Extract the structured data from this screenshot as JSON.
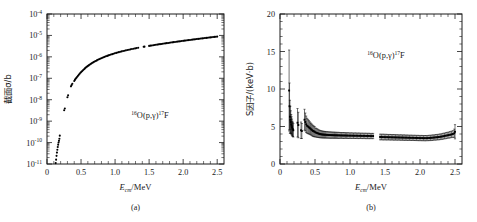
{
  "figure": {
    "panels": [
      {
        "id": "a",
        "caption": "(a)",
        "annotation": "¹⁶O(p,γ)¹⁷F",
        "annotation_parts": {
          "pre_sup": "16",
          "base": "O(p,γ)",
          "post_sup": "17",
          "tail": "F"
        },
        "xlabel_main": "E",
        "xlabel_sub": "cm",
        "xlabel_tail": "/MeV",
        "ylabel": "截面σ/b"
      },
      {
        "id": "b",
        "caption": "(b)",
        "annotation": "¹⁶O(p,γ)¹⁷F",
        "annotation_parts": {
          "pre_sup": "16",
          "base": "O(p,γ)",
          "post_sup": "17",
          "tail": "F"
        },
        "xlabel_main": "E",
        "xlabel_sub": "cm",
        "xlabel_tail": "/MeV",
        "ylabel_lead": "S",
        "ylabel": "S因子/(keV·b)"
      }
    ]
  },
  "chart_data": [
    {
      "type": "scatter",
      "panel": "a",
      "title": "",
      "annotation": "16O(p,γ)17F",
      "xlabel": "E_cm/MeV",
      "ylabel": "截面σ/b",
      "xlim": [
        0,
        2.6
      ],
      "ylim": [
        1e-11,
        0.0001
      ],
      "yscale": "log",
      "xscale": "linear",
      "grid": false,
      "legend": null,
      "xticks": [
        0,
        0.5,
        1.0,
        1.5,
        2.0,
        2.5
      ],
      "xticklabels": [
        "0",
        "0.5",
        "1.0",
        "1.5",
        "2.0",
        "2.5"
      ],
      "yticks": [
        1e-11,
        1e-10,
        1e-09,
        1e-08,
        1e-07,
        1e-06,
        1e-05,
        0.0001
      ],
      "yticklabels": [
        "10^-11",
        "10^-10",
        "10^-9",
        "10^-8",
        "10^-7",
        "10^-6",
        "10^-5",
        "10^-4"
      ],
      "x": [
        0.128,
        0.134,
        0.14,
        0.146,
        0.152,
        0.158,
        0.164,
        0.17,
        0.176,
        0.182,
        0.188,
        0.252,
        0.262,
        0.3,
        0.31,
        0.352,
        0.362,
        0.372,
        0.4,
        0.41,
        0.42,
        0.432,
        0.444,
        0.456,
        0.468,
        0.48,
        0.492,
        0.505,
        0.518,
        0.531,
        0.544,
        0.557,
        0.57,
        0.584,
        0.598,
        0.612,
        0.626,
        0.64,
        0.655,
        0.67,
        0.685,
        0.7,
        0.716,
        0.732,
        0.748,
        0.764,
        0.78,
        0.797,
        0.814,
        0.831,
        0.848,
        0.866,
        0.884,
        0.902,
        0.92,
        0.939,
        0.958,
        0.977,
        0.996,
        1.016,
        1.036,
        1.056,
        1.076,
        1.097,
        1.118,
        1.139,
        1.16,
        1.182,
        1.204,
        1.226,
        1.248,
        1.271,
        1.294,
        1.317,
        1.34,
        1.42,
        1.432,
        1.5,
        1.52,
        1.54,
        1.56,
        1.58,
        1.6,
        1.62,
        1.64,
        1.66,
        1.68,
        1.7,
        1.72,
        1.74,
        1.76,
        1.78,
        1.8,
        1.82,
        1.84,
        1.86,
        1.88,
        1.9,
        1.92,
        1.94,
        1.96,
        1.98,
        2.0,
        2.02,
        2.04,
        2.06,
        2.08,
        2.1,
        2.12,
        2.14,
        2.16,
        2.18,
        2.2,
        2.22,
        2.24,
        2.26,
        2.28,
        2.3,
        2.32,
        2.34,
        2.36,
        2.38,
        2.4,
        2.42,
        2.44,
        2.46,
        2.48,
        2.5
      ],
      "y": [
        1.1e-11,
        1.6e-11,
        2.4e-11,
        3.4e-11,
        4.6e-11,
        6.2e-11,
        8e-11,
        1e-10,
        1.2e-10,
        1.5e-10,
        2.1e-10,
        3.2e-09,
        3.9e-09,
        1.3e-08,
        1.6e-08,
        4.2e-08,
        4.8e-08,
        5.6e-08,
        7.5e-08,
        8.4e-08,
        9.4e-08,
        1.05e-07,
        1.18e-07,
        1.32e-07,
        1.47e-07,
        1.63e-07,
        1.8e-07,
        2e-07,
        2.2e-07,
        2.42e-07,
        2.65e-07,
        2.89e-07,
        3.15e-07,
        3.42e-07,
        3.7e-07,
        4e-07,
        4.31e-07,
        4.63e-07,
        4.97e-07,
        5.32e-07,
        5.68e-07,
        6.05e-07,
        6.45e-07,
        6.85e-07,
        7.27e-07,
        7.7e-07,
        8.14e-07,
        8.6e-07,
        9.07e-07,
        9.55e-07,
        1e-06,
        1.06e-06,
        1.11e-06,
        1.17e-06,
        1.22e-06,
        1.28e-06,
        1.34e-06,
        1.4e-06,
        1.47e-06,
        1.53e-06,
        1.6e-06,
        1.66e-06,
        1.73e-06,
        1.8e-06,
        1.87e-06,
        1.94e-06,
        2.01e-06,
        2.09e-06,
        2.16e-06,
        2.24e-06,
        2.32e-06,
        2.4e-06,
        2.48e-06,
        2.56e-06,
        2.64e-06,
        2.95e-06,
        3e-06,
        3.25e-06,
        3.33e-06,
        3.41e-06,
        3.49e-06,
        3.57e-06,
        3.66e-06,
        3.74e-06,
        3.83e-06,
        3.92e-06,
        4e-06,
        4.09e-06,
        4.18e-06,
        4.28e-06,
        4.37e-06,
        4.46e-06,
        4.56e-06,
        4.66e-06,
        4.75e-06,
        4.85e-06,
        4.95e-06,
        5.06e-06,
        5.16e-06,
        5.26e-06,
        5.37e-06,
        5.48e-06,
        5.59e-06,
        5.7e-06,
        5.81e-06,
        5.92e-06,
        6.04e-06,
        6.15e-06,
        6.27e-06,
        6.39e-06,
        6.51e-06,
        6.63e-06,
        6.76e-06,
        6.88e-06,
        7.01e-06,
        7.14e-06,
        7.27e-06,
        7.4e-06,
        7.54e-06,
        7.67e-06,
        7.81e-06,
        7.95e-06,
        8.09e-06,
        8.24e-06,
        8.38e-06,
        8.53e-06,
        8.68e-06,
        8.83e-06
      ]
    },
    {
      "type": "scatter",
      "panel": "b",
      "title": "",
      "annotation": "16O(p,γ)17F",
      "xlabel": "E_cm/MeV",
      "ylabel": "S因子/(keV·b)",
      "xlim": [
        0,
        2.6
      ],
      "ylim": [
        0,
        20
      ],
      "yscale": "linear",
      "xscale": "linear",
      "grid": false,
      "legend": null,
      "errorbars": true,
      "xticks": [
        0,
        0.5,
        1.0,
        1.5,
        2.0,
        2.5
      ],
      "xticklabels": [
        "0",
        "0.5",
        "1.0",
        "1.5",
        "2.0",
        "2.5"
      ],
      "yticks": [
        0,
        5,
        10,
        15,
        20
      ],
      "yticklabels": [
        "0",
        "5",
        "10",
        "15",
        "20"
      ],
      "x": [
        0.13,
        0.136,
        0.142,
        0.148,
        0.154,
        0.16,
        0.166,
        0.172,
        0.178,
        0.184,
        0.19,
        0.25,
        0.262,
        0.3,
        0.312,
        0.35,
        0.362,
        0.374,
        0.386,
        0.4,
        0.412,
        0.424,
        0.436,
        0.448,
        0.46,
        0.472,
        0.484,
        0.496,
        0.51,
        0.524,
        0.538,
        0.552,
        0.566,
        0.58,
        0.594,
        0.608,
        0.622,
        0.636,
        0.65,
        0.666,
        0.682,
        0.698,
        0.714,
        0.73,
        0.746,
        0.762,
        0.778,
        0.794,
        0.81,
        0.826,
        0.844,
        0.862,
        0.88,
        0.898,
        0.916,
        0.934,
        0.952,
        0.97,
        0.99,
        1.01,
        1.03,
        1.05,
        1.07,
        1.09,
        1.11,
        1.13,
        1.15,
        1.17,
        1.19,
        1.21,
        1.23,
        1.25,
        1.27,
        1.29,
        1.31,
        1.33,
        1.43,
        1.45,
        1.47,
        1.49,
        1.51,
        1.53,
        1.55,
        1.57,
        1.59,
        1.61,
        1.63,
        1.65,
        1.67,
        1.69,
        1.71,
        1.73,
        1.75,
        1.77,
        1.79,
        1.81,
        1.83,
        1.85,
        1.87,
        1.89,
        1.91,
        1.93,
        1.95,
        1.97,
        1.99,
        2.01,
        2.03,
        2.05,
        2.07,
        2.09,
        2.11,
        2.13,
        2.15,
        2.17,
        2.19,
        2.21,
        2.23,
        2.25,
        2.27,
        2.29,
        2.31,
        2.33,
        2.35,
        2.37,
        2.39,
        2.41,
        2.43,
        2.45,
        2.47,
        2.49,
        2.5
      ],
      "y": [
        9.8,
        7.7,
        6.3,
        5.9,
        5.6,
        5.3,
        5.1,
        4.9,
        4.7,
        4.6,
        4.5,
        5.5,
        5.2,
        4.5,
        4.4,
        5.9,
        5.6,
        5.3,
        5.1,
        5.0,
        4.9,
        4.8,
        4.7,
        4.6,
        4.5,
        4.4,
        4.35,
        4.3,
        4.2,
        4.15,
        4.1,
        4.05,
        4.0,
        3.98,
        3.95,
        3.93,
        3.92,
        3.9,
        3.9,
        3.88,
        3.88,
        3.86,
        3.86,
        3.85,
        3.85,
        3.84,
        3.84,
        3.83,
        3.83,
        3.82,
        3.82,
        3.81,
        3.81,
        3.8,
        3.8,
        3.8,
        3.79,
        3.79,
        3.78,
        3.78,
        3.78,
        3.77,
        3.77,
        3.77,
        3.76,
        3.76,
        3.76,
        3.75,
        3.75,
        3.75,
        3.74,
        3.74,
        3.74,
        3.73,
        3.73,
        3.73,
        3.6,
        3.6,
        3.59,
        3.59,
        3.58,
        3.58,
        3.57,
        3.57,
        3.56,
        3.56,
        3.55,
        3.55,
        3.54,
        3.54,
        3.53,
        3.53,
        3.52,
        3.52,
        3.51,
        3.51,
        3.5,
        3.5,
        3.49,
        3.49,
        3.48,
        3.48,
        3.47,
        3.47,
        3.46,
        3.46,
        3.46,
        3.45,
        3.45,
        3.45,
        3.46,
        3.47,
        3.48,
        3.5,
        3.52,
        3.54,
        3.56,
        3.58,
        3.6,
        3.63,
        3.66,
        3.7,
        3.74,
        3.78,
        3.82,
        3.86,
        3.9,
        3.95,
        4.0,
        4.1,
        4.3
      ],
      "yerr": [
        5.4,
        3.1,
        2.2,
        1.8,
        1.5,
        1.3,
        1.2,
        1.1,
        1.0,
        0.95,
        0.9,
        1.9,
        1.7,
        1.1,
        1.0,
        1.4,
        1.2,
        1.1,
        1.0,
        0.95,
        0.9,
        0.85,
        0.8,
        0.78,
        0.75,
        0.72,
        0.7,
        0.68,
        0.6,
        0.58,
        0.55,
        0.52,
        0.5,
        0.48,
        0.47,
        0.46,
        0.45,
        0.44,
        0.44,
        0.43,
        0.43,
        0.42,
        0.42,
        0.42,
        0.41,
        0.41,
        0.41,
        0.4,
        0.4,
        0.4,
        0.4,
        0.39,
        0.39,
        0.39,
        0.39,
        0.38,
        0.38,
        0.38,
        0.38,
        0.38,
        0.37,
        0.37,
        0.37,
        0.37,
        0.37,
        0.37,
        0.36,
        0.36,
        0.36,
        0.36,
        0.36,
        0.36,
        0.36,
        0.35,
        0.35,
        0.35,
        0.38,
        0.38,
        0.38,
        0.38,
        0.38,
        0.37,
        0.37,
        0.37,
        0.37,
        0.37,
        0.37,
        0.37,
        0.36,
        0.36,
        0.36,
        0.36,
        0.36,
        0.36,
        0.36,
        0.36,
        0.35,
        0.35,
        0.35,
        0.35,
        0.35,
        0.35,
        0.35,
        0.35,
        0.35,
        0.35,
        0.35,
        0.35,
        0.35,
        0.35,
        0.35,
        0.35,
        0.36,
        0.36,
        0.36,
        0.36,
        0.37,
        0.37,
        0.37,
        0.38,
        0.38,
        0.39,
        0.39,
        0.4,
        0.4,
        0.41,
        0.42,
        0.43,
        0.45,
        0.55,
        0.95
      ]
    }
  ]
}
